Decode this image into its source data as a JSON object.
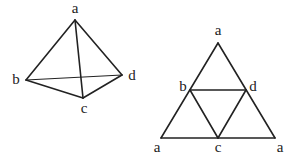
{
  "figure": {
    "left": {
      "name": "tetrahedron",
      "vertices": {
        "a": {
          "label": "a",
          "x": 75,
          "y": 20,
          "lx": 75,
          "ly": 10
        },
        "b": {
          "label": "b",
          "x": 26,
          "y": 80,
          "lx": 16,
          "ly": 81
        },
        "c": {
          "label": "c",
          "x": 83,
          "y": 98,
          "lx": 84,
          "ly": 110
        },
        "d": {
          "label": "d",
          "x": 122,
          "y": 75,
          "lx": 132,
          "ly": 77
        }
      },
      "edges": [
        [
          "a",
          "b"
        ],
        [
          "a",
          "c"
        ],
        [
          "a",
          "d"
        ],
        [
          "b",
          "c"
        ],
        [
          "c",
          "d"
        ],
        [
          "b",
          "d"
        ]
      ]
    },
    "right": {
      "name": "tetrahedron-net",
      "vertices": {
        "a_top": {
          "label": "a",
          "x": 218,
          "y": 43,
          "lx": 218,
          "ly": 32
        },
        "b": {
          "label": "b",
          "x": 190,
          "y": 90,
          "lx": 183,
          "ly": 88
        },
        "d": {
          "label": "d",
          "x": 246,
          "y": 90,
          "lx": 253,
          "ly": 88
        },
        "a_left": {
          "label": "a",
          "x": 161,
          "y": 138,
          "lx": 157,
          "ly": 149
        },
        "c": {
          "label": "c",
          "x": 218,
          "y": 138,
          "lx": 218,
          "ly": 149
        },
        "a_right": {
          "label": "a",
          "x": 275,
          "y": 138,
          "lx": 280,
          "ly": 149
        }
      },
      "edges": [
        [
          "a_top",
          "a_left"
        ],
        [
          "a_top",
          "a_right"
        ],
        [
          "a_left",
          "a_right"
        ],
        [
          "b",
          "d"
        ],
        [
          "b",
          "c"
        ],
        [
          "d",
          "c"
        ]
      ]
    },
    "stroke_color": "#222222",
    "background": "#ffffff"
  }
}
